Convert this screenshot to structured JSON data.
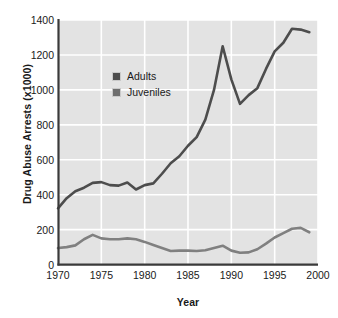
{
  "chart_data": {
    "type": "line",
    "title": "",
    "xlabel": "Year",
    "ylabel": "Drug Abuse Arrests (x1000)",
    "xlim": [
      1970,
      2000
    ],
    "ylim": [
      0,
      1400
    ],
    "xticks": [
      1970,
      1975,
      1980,
      1985,
      1990,
      1995,
      2000
    ],
    "yticks": [
      0,
      200,
      400,
      600,
      800,
      1000,
      1200,
      1400
    ],
    "grid": true,
    "legend_position": "upper-left-inside",
    "plot_background": "#e3e3e3",
    "gridline_color": "#ffffff",
    "axis_color": "#3a3a3a",
    "x": [
      1970,
      1971,
      1972,
      1973,
      1974,
      1975,
      1976,
      1977,
      1978,
      1979,
      1980,
      1981,
      1982,
      1983,
      1984,
      1985,
      1986,
      1987,
      1988,
      1989,
      1990,
      1991,
      1992,
      1993,
      1994,
      1995,
      1996,
      1997,
      1998,
      1999
    ],
    "series": [
      {
        "name": "Adults",
        "color": "#4d4d4d",
        "values": [
          322,
          380,
          420,
          440,
          468,
          472,
          455,
          452,
          470,
          430,
          455,
          465,
          520,
          580,
          620,
          680,
          730,
          830,
          1000,
          1250,
          1060,
          920,
          970,
          1010,
          1120,
          1220,
          1270,
          1350,
          1345,
          1330
        ]
      },
      {
        "name": "Juveniles",
        "color": "#808080",
        "values": [
          95,
          100,
          110,
          145,
          170,
          150,
          145,
          145,
          150,
          145,
          130,
          112,
          95,
          78,
          80,
          80,
          78,
          82,
          95,
          108,
          80,
          68,
          70,
          88,
          120,
          155,
          180,
          205,
          210,
          185
        ]
      }
    ]
  },
  "legend": {
    "items": [
      {
        "label": "Adults",
        "color": "#4d4d4d"
      },
      {
        "label": "Juveniles",
        "color": "#6e6e6e"
      }
    ]
  }
}
